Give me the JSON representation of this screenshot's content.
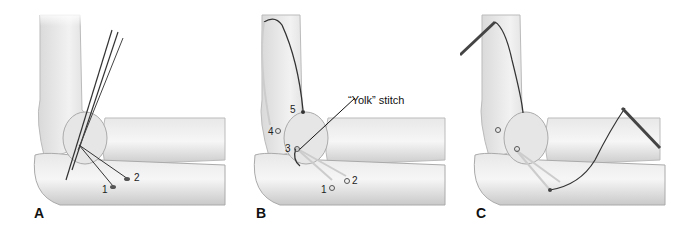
{
  "figure": {
    "panels": [
      {
        "id": "A",
        "label": "A",
        "markers": [
          "1",
          "2"
        ]
      },
      {
        "id": "B",
        "label": "B",
        "markers": [
          "1",
          "2",
          "3",
          "4",
          "5"
        ],
        "callout": "“Yolk” stitch"
      },
      {
        "id": "C",
        "label": "C",
        "markers": []
      }
    ]
  }
}
